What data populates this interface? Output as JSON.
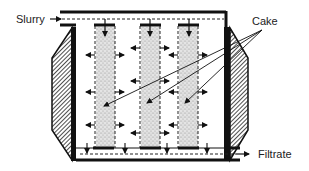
{
  "diagram": {
    "type": "filter-press-schematic",
    "labels": {
      "inlet": "Slurry",
      "cake": "Cake",
      "outlet": "Filtrate"
    },
    "colors": {
      "line": "#111111",
      "cake_fill": "#cfcfcf",
      "background": "#ffffff"
    },
    "cake_columns": [
      {
        "x": 95,
        "width": 20
      },
      {
        "x": 140,
        "width": 20
      },
      {
        "x": 178,
        "width": 20
      }
    ],
    "flow": {
      "inlet_direction": "right",
      "outlet_direction": "right",
      "cake_pointer_count": 3
    }
  }
}
